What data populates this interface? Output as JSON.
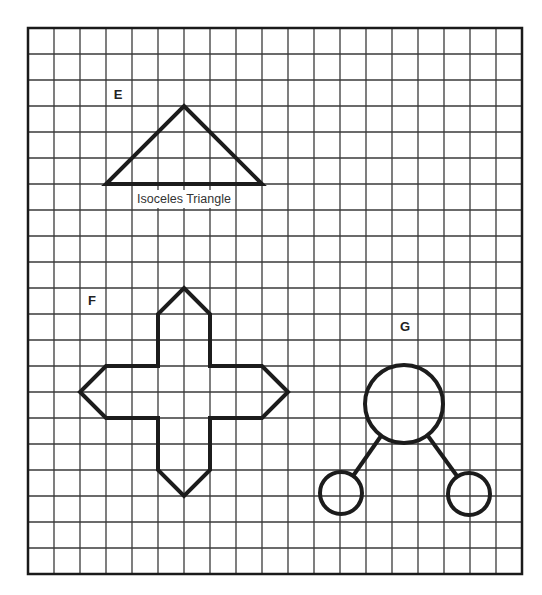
{
  "grid": {
    "x0": 28,
    "y0": 28,
    "cell": 26,
    "cols": 19,
    "rows": 21,
    "line_color": "#3a3a3a",
    "border_color": "#1a1a1a"
  },
  "figures": [
    {
      "id": "E",
      "label": "E",
      "label_pos": [
        118,
        99
      ],
      "type": "triangle",
      "caption": "Isoceles Triangle",
      "caption_pos": [
        184,
        203
      ],
      "points": [
        [
          184,
          106
        ],
        [
          262,
          184
        ],
        [
          106,
          184
        ]
      ]
    },
    {
      "id": "F",
      "label": "F",
      "label_pos": [
        92,
        305
      ],
      "type": "cross",
      "points": [
        [
          184,
          288
        ],
        [
          210,
          314
        ],
        [
          210,
          366
        ],
        [
          262,
          366
        ],
        [
          288,
          392
        ],
        [
          262,
          418
        ],
        [
          210,
          418
        ],
        [
          210,
          470
        ],
        [
          184,
          496
        ],
        [
          158,
          470
        ],
        [
          158,
          418
        ],
        [
          106,
          418
        ],
        [
          80,
          392
        ],
        [
          106,
          366
        ],
        [
          158,
          366
        ],
        [
          158,
          314
        ]
      ]
    },
    {
      "id": "G",
      "label": "G",
      "label_pos": [
        405,
        331
      ],
      "type": "circle-tree",
      "main_circle": {
        "cx": 404,
        "cy": 404,
        "r": 39
      },
      "child_circles": [
        {
          "cx": 341,
          "cy": 493,
          "r": 21
        },
        {
          "cx": 469,
          "cy": 494,
          "r": 21
        }
      ],
      "connectors": [
        [
          [
            381,
            436
          ],
          [
            353,
            476
          ]
        ],
        [
          [
            428,
            436
          ],
          [
            457,
            476
          ]
        ]
      ]
    }
  ],
  "stroke_color": "#1c1c1c"
}
